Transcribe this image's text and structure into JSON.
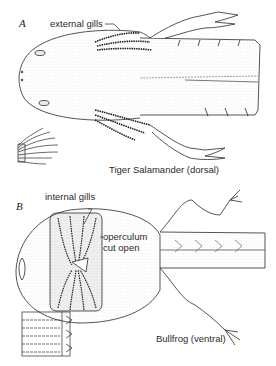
{
  "figure": {
    "top_caption_fragment": "",
    "panels": [
      {
        "id": "A",
        "letter": "A",
        "labels": {
          "gills": "external gills"
        },
        "caption": "Tiger Salamander (dorsal)"
      },
      {
        "id": "B",
        "letter": "B",
        "labels": {
          "gills": "internal gills",
          "operculum": "operculum\ncut open",
          "operculum_line1": "operculum",
          "operculum_line2": "cut open"
        },
        "caption": "Bullfrog (ventral)"
      }
    ],
    "colors": {
      "ink": "#2a2a2a",
      "paper": "#ffffff",
      "stipple": "#9a9a9a"
    }
  }
}
